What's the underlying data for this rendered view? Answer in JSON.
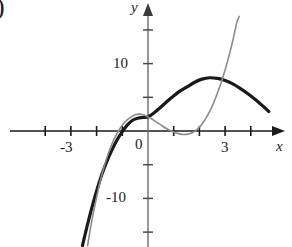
{
  "figure": {
    "corner_mark": ")",
    "x_axis_label": "x",
    "y_axis_label": "y"
  },
  "chart_data": {
    "type": "line",
    "title": "",
    "xlabel": "x",
    "ylabel": "y",
    "grid": false,
    "legend": "none",
    "xlim": [
      -4.2,
      5.0
    ],
    "ylim": [
      -17.0,
      17.0
    ],
    "x_ticks": [
      -4,
      -3,
      -2,
      -1,
      1,
      2,
      3,
      4
    ],
    "x_tick_labels": [
      {
        "value": -3,
        "label": "-3"
      },
      {
        "value": 3,
        "label": "3"
      }
    ],
    "y_ticks": [
      -15,
      -10,
      -5,
      5,
      10,
      15
    ],
    "y_tick_labels": [
      {
        "value": 10,
        "label": "10"
      },
      {
        "value": -10,
        "label": "-10"
      }
    ],
    "origin_label": "0",
    "series": [
      {
        "name": "dark-curve",
        "color": "#1a1a1a",
        "width": 3.2,
        "points": [
          [
            -2.55,
            -17.0
          ],
          [
            -2.4,
            -14.6
          ],
          [
            -2.2,
            -11.6
          ],
          [
            -2.0,
            -8.9
          ],
          [
            -1.8,
            -6.5
          ],
          [
            -1.6,
            -4.5
          ],
          [
            -1.4,
            -2.8
          ],
          [
            -1.2,
            -1.3
          ],
          [
            -1.0,
            -0.1
          ],
          [
            -0.8,
            0.9
          ],
          [
            -0.6,
            1.6
          ],
          [
            -0.4,
            1.9
          ],
          [
            -0.2,
            2.0
          ],
          [
            0.0,
            2.1
          ],
          [
            0.3,
            2.9
          ],
          [
            0.6,
            3.9
          ],
          [
            0.9,
            4.9
          ],
          [
            1.2,
            5.8
          ],
          [
            1.5,
            6.5
          ],
          [
            1.8,
            7.2
          ],
          [
            2.1,
            7.7
          ],
          [
            2.4,
            7.9
          ],
          [
            2.7,
            7.8
          ],
          [
            3.0,
            7.5
          ],
          [
            3.3,
            7.0
          ],
          [
            3.6,
            6.3
          ],
          [
            3.9,
            5.5
          ],
          [
            4.2,
            4.6
          ],
          [
            4.5,
            3.6
          ],
          [
            4.7,
            2.9
          ]
        ]
      },
      {
        "name": "gray-curve",
        "color": "#8a8a8a",
        "width": 1.6,
        "points": [
          [
            -2.35,
            -17.0
          ],
          [
            -2.2,
            -13.6
          ],
          [
            -2.0,
            -9.8
          ],
          [
            -1.85,
            -7.3
          ],
          [
            -1.7,
            -5.2
          ],
          [
            -1.55,
            -3.4
          ],
          [
            -1.4,
            -1.9
          ],
          [
            -1.25,
            -0.7
          ],
          [
            -1.1,
            0.3
          ],
          [
            -0.95,
            1.1
          ],
          [
            -0.8,
            1.7
          ],
          [
            -0.65,
            2.1
          ],
          [
            -0.5,
            2.4
          ],
          [
            -0.35,
            2.5
          ],
          [
            -0.2,
            2.4
          ],
          [
            -0.05,
            2.2
          ],
          [
            0.1,
            1.9
          ],
          [
            0.3,
            1.4
          ],
          [
            0.5,
            0.9
          ],
          [
            0.7,
            0.4
          ],
          [
            0.9,
            0.0
          ],
          [
            1.1,
            -0.3
          ],
          [
            1.3,
            -0.5
          ],
          [
            1.5,
            -0.5
          ],
          [
            1.7,
            -0.3
          ],
          [
            1.9,
            0.2
          ],
          [
            2.1,
            1.0
          ],
          [
            2.3,
            2.2
          ],
          [
            2.5,
            3.7
          ],
          [
            2.7,
            5.6
          ],
          [
            2.9,
            7.8
          ],
          [
            3.1,
            10.4
          ],
          [
            3.3,
            13.4
          ],
          [
            3.45,
            16.0
          ],
          [
            3.55,
            17.0
          ]
        ]
      }
    ]
  }
}
